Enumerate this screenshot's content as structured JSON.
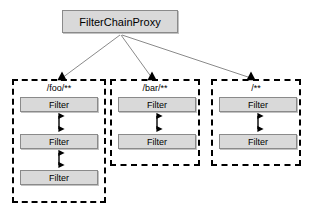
{
  "diagram": {
    "type": "block-diagram",
    "canvas": {
      "width": 314,
      "height": 218,
      "background": "#ffffff"
    },
    "colors": {
      "node_fill": "#d9d9d9",
      "node_border": "#8a8a8a",
      "group_border": "#000000",
      "edge_line": "#8a8a8a",
      "arrow_fill": "#000000",
      "text": "#000000"
    },
    "root": {
      "label": "FilterChainProxy"
    },
    "groups": [
      {
        "id": "foo",
        "label": "/foo/**",
        "filters": [
          {
            "label": "Filter"
          },
          {
            "label": "Filter"
          },
          {
            "label": "Filter"
          }
        ]
      },
      {
        "id": "bar",
        "label": "/bar/**",
        "filters": [
          {
            "label": "Filter"
          },
          {
            "label": "Filter"
          }
        ]
      },
      {
        "id": "all",
        "label": "/**",
        "filters": [
          {
            "label": "Filter"
          },
          {
            "label": "Filter"
          }
        ]
      }
    ],
    "edges": [
      {
        "from": "FilterChainProxy",
        "to": "/foo/**",
        "style": "solid",
        "arrow": "single"
      },
      {
        "from": "FilterChainProxy",
        "to": "/bar/**",
        "style": "solid",
        "arrow": "single"
      },
      {
        "from": "FilterChainProxy",
        "to": "/**",
        "style": "solid",
        "arrow": "single"
      },
      {
        "from": "Filter",
        "to": "Filter",
        "style": "solid",
        "arrow": "double"
      }
    ]
  }
}
